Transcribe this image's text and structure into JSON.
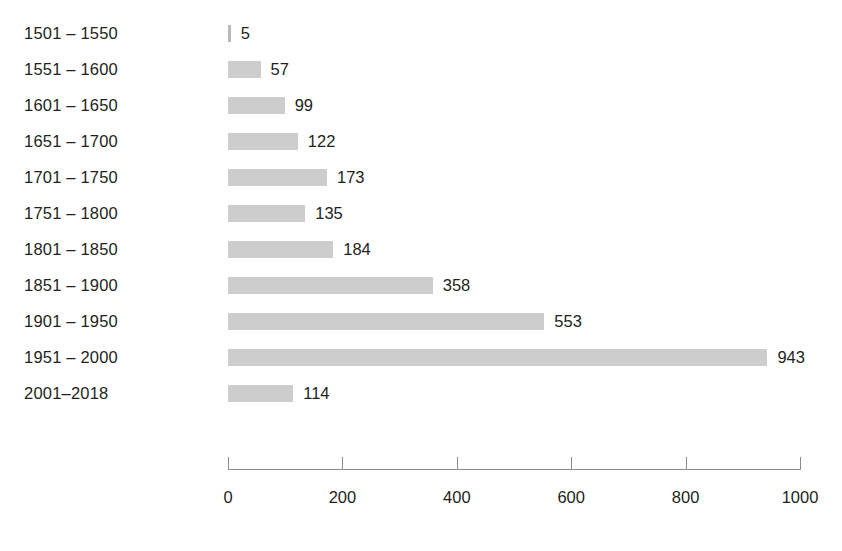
{
  "chart_data": {
    "type": "bar",
    "orientation": "horizontal",
    "title": "",
    "subtitle": "",
    "xlabel": "",
    "ylabel": "",
    "grid": false,
    "legend": null,
    "xlim": [
      0,
      1000
    ],
    "categories": [
      "1501 – 1550",
      "1551 – 1600",
      "1601 – 1650",
      "1651 – 1700",
      "1701 – 1750",
      "1751 – 1800",
      "1801 – 1850",
      "1851 – 1900",
      "1901 – 1950",
      "1951 – 2000",
      "2001–2018"
    ],
    "values": [
      5,
      57,
      99,
      122,
      173,
      135,
      184,
      358,
      553,
      943,
      114
    ],
    "value_labels": [
      "5",
      "57",
      "99",
      "122",
      "173",
      "135",
      "184",
      "358",
      "553",
      "943",
      "114"
    ],
    "xticks": [
      0,
      200,
      400,
      600,
      800,
      1000
    ],
    "xtick_labels": [
      "0",
      "200",
      "400",
      "600",
      "800",
      "1000"
    ],
    "colors": {
      "bar_fill": "#cdcdcd",
      "text": "#231f20",
      "axis": "#8d8d8d",
      "background": "#ffffff"
    }
  }
}
